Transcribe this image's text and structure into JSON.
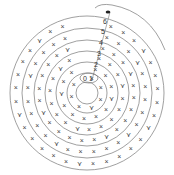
{
  "diagram": {
    "type": "crochet spiral chart",
    "center": [
      87,
      93
    ],
    "row_numbers": [
      "0",
      "1",
      "2",
      "3",
      "4",
      "5",
      "6"
    ],
    "stitch_symbol": "×",
    "increase_symbol": "⋎",
    "start_marker": "●",
    "colors": {
      "line": "#777777",
      "text": "#333333",
      "background": "#ffffff"
    }
  }
}
